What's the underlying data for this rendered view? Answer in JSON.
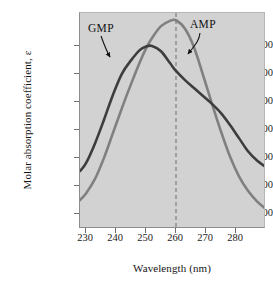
{
  "chart_data": {
    "type": "line",
    "title": "",
    "xlabel": "Wavelength (nm)",
    "ylabel": "Molar absorption coefficient, ε",
    "xlim": [
      228,
      290
    ],
    "ylim": [
      0,
      16400
    ],
    "xticks": [
      230,
      240,
      250,
      260,
      270,
      280
    ],
    "xtick_labels": [
      "230",
      "240",
      "250",
      "260",
      "270",
      "280"
    ],
    "yticks": [
      2000,
      4000,
      6000,
      8000,
      10000,
      12000,
      14000
    ],
    "ytick_labels": [
      "2,000",
      "4,000",
      "6,000",
      "8,000",
      "10,000",
      "12,000",
      "14,000"
    ],
    "grid": false,
    "legend_position": "inline-annotations",
    "background": "#d2d2d2",
    "reference_line": {
      "orientation": "vertical",
      "x": 260,
      "style": "dashed",
      "color": "#6f6f6f"
    },
    "series": [
      {
        "name": "GMP",
        "color": "#3d3d3d",
        "label": "GMP",
        "x": [
          228,
          230,
          233,
          236,
          239,
          242,
          245,
          248,
          250,
          252,
          255,
          258,
          260,
          263,
          266,
          269,
          272,
          275,
          278,
          281,
          284,
          287,
          290
        ],
        "values": [
          4400,
          5000,
          6500,
          8300,
          10200,
          11800,
          12800,
          13600,
          13850,
          13900,
          13500,
          12600,
          12000,
          11300,
          10700,
          10100,
          9500,
          8800,
          7900,
          6900,
          5900,
          5200,
          4700
        ]
      },
      {
        "name": "AMP",
        "color": "#808080",
        "label": "AMP",
        "x": [
          228,
          230,
          233,
          236,
          239,
          242,
          245,
          248,
          250,
          252,
          255,
          258,
          260,
          263,
          266,
          269,
          272,
          275,
          278,
          281,
          284,
          287,
          290
        ],
        "values": [
          2200,
          2700,
          3800,
          5400,
          7300,
          9200,
          11000,
          12700,
          13700,
          14500,
          15400,
          15800,
          15850,
          15200,
          13800,
          11700,
          9500,
          7400,
          5500,
          4000,
          2900,
          2100,
          1500
        ]
      }
    ],
    "annotations": [
      {
        "text": "GMP",
        "points_to_series": "GMP",
        "arrow": "down-right"
      },
      {
        "text": "AMP",
        "points_to_series": "AMP",
        "arrow": "down-left"
      }
    ]
  }
}
